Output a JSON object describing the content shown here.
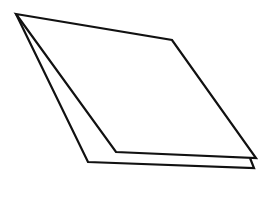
{
  "diagram": {
    "description": "Two stacked sheets of paper drawn as parallelograms in line art",
    "stroke_color": "#111111",
    "background": "#ffffff",
    "stroke_width": 2.2,
    "shapes": [
      {
        "name": "back-sheet",
        "points": [
          [
            16,
            14
          ],
          [
            88,
            162
          ],
          [
            254,
            168
          ],
          [
            250,
            158
          ]
        ]
      },
      {
        "name": "front-sheet",
        "points": [
          [
            16,
            14
          ],
          [
            172,
            40
          ],
          [
            256,
            158
          ],
          [
            116,
            152
          ]
        ]
      }
    ]
  }
}
